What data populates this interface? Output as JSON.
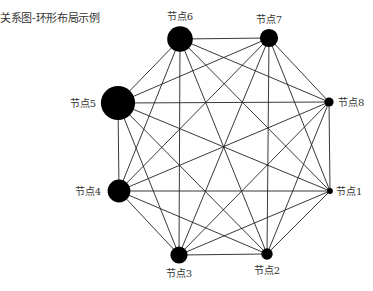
{
  "title": "关系图-环形布局示例",
  "diagram": {
    "type": "graph",
    "layout": "circular",
    "colors": {
      "node": "#000000",
      "edge": "#222222",
      "label": "#333333"
    },
    "nodes": [
      {
        "id": "n1",
        "label": "节点1",
        "relative_size": 1
      },
      {
        "id": "n2",
        "label": "节点2",
        "relative_size": 2
      },
      {
        "id": "n3",
        "label": "节点3",
        "relative_size": 3
      },
      {
        "id": "n4",
        "label": "节点4",
        "relative_size": 4
      },
      {
        "id": "n5",
        "label": "节点5",
        "relative_size": 6
      },
      {
        "id": "n6",
        "label": "节点6",
        "relative_size": 4.5
      },
      {
        "id": "n7",
        "label": "节点7",
        "relative_size": 3.2
      },
      {
        "id": "n8",
        "label": "节点8",
        "relative_size": 1.6
      }
    ],
    "edges": "all-pairs"
  }
}
